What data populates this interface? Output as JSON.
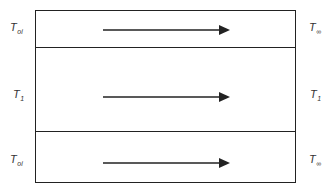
{
  "diagram": {
    "layers": [
      {
        "name": "top",
        "left_label": {
          "base": "T",
          "sub": "oi"
        },
        "right_label": {
          "base": "T",
          "sub": "∞"
        },
        "arrow_direction": "right"
      },
      {
        "name": "middle",
        "left_label": {
          "base": "T",
          "sub": "1"
        },
        "right_label": {
          "base": "T",
          "sub": "1"
        },
        "arrow_direction": "right"
      },
      {
        "name": "bottom",
        "left_label": {
          "base": "T",
          "sub": "oi"
        },
        "right_label": {
          "base": "T",
          "sub": "∞"
        },
        "arrow_direction": "right"
      }
    ],
    "line_color": "#222222"
  }
}
